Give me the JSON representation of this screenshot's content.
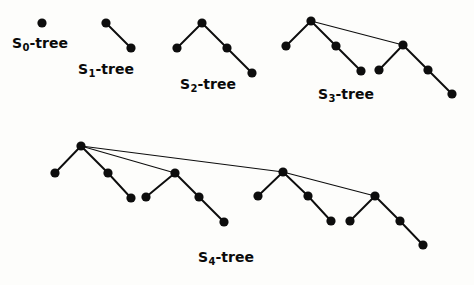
{
  "figure": {
    "title": "",
    "background_color": "#fdfdfb",
    "ink_color": "#0d0d0d",
    "node_radius": 4.6,
    "labels": [
      {
        "id": "s0",
        "prefix": "S",
        "subscript": "0",
        "suffix": "-tree",
        "text": "S0-tree",
        "x": 12,
        "y": 36
      },
      {
        "id": "s1",
        "prefix": "S",
        "subscript": "1",
        "suffix": "-tree",
        "text": "S1-tree",
        "x": 78,
        "y": 62
      },
      {
        "id": "s2",
        "prefix": "S",
        "subscript": "2",
        "suffix": "-tree",
        "text": "S2-tree",
        "x": 180,
        "y": 77
      },
      {
        "id": "s3",
        "prefix": "S",
        "subscript": "3",
        "suffix": "-tree",
        "text": "S3-tree",
        "x": 318,
        "y": 87
      },
      {
        "id": "s4",
        "prefix": "S",
        "subscript": "4",
        "suffix": "-tree",
        "text": "S4-tree",
        "x": 198,
        "y": 250
      }
    ]
  },
  "chart_data": {
    "type": "diagram",
    "trees": [
      {
        "name": "S0-tree",
        "order": 0,
        "node_count": 1,
        "label": "S0-tree",
        "nodes": [
          {
            "id": "n0",
            "x": 42,
            "y": 23
          }
        ],
        "edges": []
      },
      {
        "name": "S1-tree",
        "order": 1,
        "node_count": 2,
        "label": "S1-tree",
        "nodes": [
          {
            "id": "n0",
            "x": 106,
            "y": 23
          },
          {
            "id": "n1",
            "x": 131,
            "y": 48
          }
        ],
        "edges": [
          {
            "from": "n0",
            "to": "n1"
          }
        ]
      },
      {
        "name": "S2-tree",
        "order": 2,
        "node_count": 4,
        "label": "S2-tree",
        "nodes": [
          {
            "id": "n0",
            "x": 202,
            "y": 23
          },
          {
            "id": "n1",
            "x": 177,
            "y": 48
          },
          {
            "id": "n2",
            "x": 227,
            "y": 48
          },
          {
            "id": "n3",
            "x": 252,
            "y": 73
          }
        ],
        "edges": [
          {
            "from": "n0",
            "to": "n1"
          },
          {
            "from": "n0",
            "to": "n2"
          },
          {
            "from": "n2",
            "to": "n3"
          }
        ]
      },
      {
        "name": "S3-tree",
        "order": 3,
        "node_count": 8,
        "label": "S3-tree",
        "nodes": [
          {
            "id": "n0",
            "x": 311,
            "y": 21
          },
          {
            "id": "n1",
            "x": 286,
            "y": 46
          },
          {
            "id": "n2",
            "x": 336,
            "y": 46
          },
          {
            "id": "n3",
            "x": 361,
            "y": 71
          },
          {
            "id": "n4",
            "x": 403,
            "y": 45
          },
          {
            "id": "n5",
            "x": 379,
            "y": 70
          },
          {
            "id": "n6",
            "x": 428,
            "y": 70
          },
          {
            "id": "n7",
            "x": 452,
            "y": 94
          }
        ],
        "edges": [
          {
            "from": "n0",
            "to": "n1"
          },
          {
            "from": "n0",
            "to": "n2"
          },
          {
            "from": "n2",
            "to": "n3"
          },
          {
            "from": "n0",
            "to": "n4"
          },
          {
            "from": "n4",
            "to": "n5"
          },
          {
            "from": "n4",
            "to": "n6"
          },
          {
            "from": "n6",
            "to": "n7"
          }
        ]
      },
      {
        "name": "S4-tree",
        "order": 4,
        "node_count": 16,
        "label": "S4-tree",
        "nodes": [
          {
            "id": "n0",
            "x": 81,
            "y": 146
          },
          {
            "id": "n1",
            "x": 55,
            "y": 173
          },
          {
            "id": "n2",
            "x": 108,
            "y": 173
          },
          {
            "id": "n3",
            "x": 131,
            "y": 198
          },
          {
            "id": "n4",
            "x": 175,
            "y": 173
          },
          {
            "id": "n5",
            "x": 146,
            "y": 197
          },
          {
            "id": "n6",
            "x": 199,
            "y": 197
          },
          {
            "id": "n7",
            "x": 224,
            "y": 222
          },
          {
            "id": "n8",
            "x": 283,
            "y": 172
          },
          {
            "id": "n9",
            "x": 258,
            "y": 196
          },
          {
            "id": "n10",
            "x": 308,
            "y": 196
          },
          {
            "id": "n11",
            "x": 331,
            "y": 221
          },
          {
            "id": "n12",
            "x": 375,
            "y": 196
          },
          {
            "id": "n13",
            "x": 350,
            "y": 221
          },
          {
            "id": "n14",
            "x": 400,
            "y": 221
          },
          {
            "id": "n15",
            "x": 423,
            "y": 245
          }
        ],
        "edges": [
          {
            "from": "n0",
            "to": "n1"
          },
          {
            "from": "n0",
            "to": "n2"
          },
          {
            "from": "n2",
            "to": "n3"
          },
          {
            "from": "n0",
            "to": "n4"
          },
          {
            "from": "n4",
            "to": "n5"
          },
          {
            "from": "n4",
            "to": "n6"
          },
          {
            "from": "n6",
            "to": "n7"
          },
          {
            "from": "n0",
            "to": "n8"
          },
          {
            "from": "n8",
            "to": "n9"
          },
          {
            "from": "n8",
            "to": "n10"
          },
          {
            "from": "n10",
            "to": "n11"
          },
          {
            "from": "n8",
            "to": "n12"
          },
          {
            "from": "n12",
            "to": "n13"
          },
          {
            "from": "n12",
            "to": "n14"
          },
          {
            "from": "n14",
            "to": "n15"
          }
        ]
      }
    ]
  }
}
